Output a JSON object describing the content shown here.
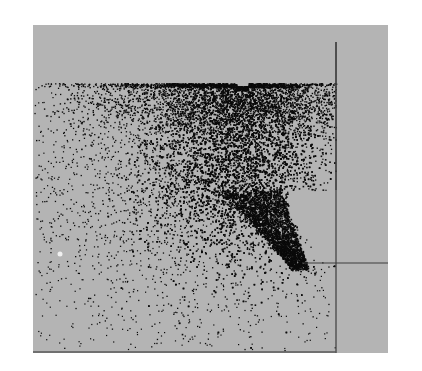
{
  "chart_data": {
    "type": "scatter",
    "title": "",
    "xlabel": "",
    "ylabel": "",
    "grid": false,
    "legend": null,
    "frame": {
      "x": 33,
      "y": 25,
      "width": 355,
      "height": 328
    },
    "colors": {
      "background": "#ffffff",
      "panel": "#b4b4b4",
      "ink": "#0a0a0a",
      "line": "#3c3c3c",
      "frame_bottom": "#5a5a5a"
    },
    "ref_lines": [
      {
        "orientation": "vertical",
        "x": 336,
        "y1": 42,
        "y2": 353
      },
      {
        "orientation": "horizontal",
        "y": 263,
        "x1": 302,
        "x2": 388
      },
      {
        "orientation": "vertical-short",
        "x": 336,
        "y1": 42,
        "y2": 190
      }
    ],
    "clusters": [
      {
        "name": "dense-core",
        "cx": 235,
        "cy": 150,
        "sx": 42,
        "sy": 55,
        "n": 5200,
        "size": 1.6
      },
      {
        "name": "upper-band",
        "cx": 240,
        "cy": 100,
        "sx": 75,
        "sy": 16,
        "n": 2600,
        "size": 1.4
      },
      {
        "name": "tail",
        "x0": 250,
        "y0": 190,
        "x1": 300,
        "y1": 268,
        "width0": 30,
        "width1": 8,
        "n": 2200,
        "size": 1.6
      },
      {
        "name": "diffuse-halo",
        "cx": 190,
        "cy": 170,
        "sx": 85,
        "sy": 75,
        "n": 2400,
        "size": 1.3
      },
      {
        "name": "sparse-background",
        "x0": 35,
        "y0": 83,
        "x1": 335,
        "y1": 350,
        "n": 700,
        "size": 1.2
      }
    ],
    "top_cutoff_y": 83,
    "highlights": [
      {
        "x": 60,
        "y": 254,
        "r": 2.5,
        "color": "#f0f0f0"
      }
    ]
  }
}
